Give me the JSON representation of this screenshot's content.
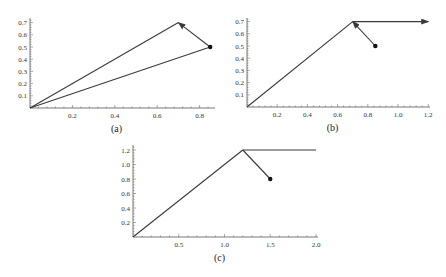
{
  "figure": {
    "background": "#ffffff",
    "line_color": "#3a3a3a"
  },
  "chart_data": [
    {
      "id": "a",
      "type": "line",
      "caption": "(a)",
      "xlabel": "",
      "ylabel": "",
      "xlim": [
        0,
        0.87
      ],
      "ylim": [
        0,
        0.72
      ],
      "xticks": [
        0.2,
        0.4,
        0.6,
        0.8
      ],
      "xtick_labels": [
        "0.2",
        "0.4",
        "0.6",
        "0.8"
      ],
      "yticks": [
        0.1,
        0.2,
        0.3,
        0.4,
        0.5,
        0.6,
        0.7
      ],
      "ytick_labels": [
        "0.1",
        "0.2",
        "0.3",
        "0.4",
        "0.5",
        "0.6",
        "0.7"
      ],
      "grid": false,
      "series": [
        {
          "name": "segment-origin-to-peak",
          "x": [
            0,
            0.7
          ],
          "y": [
            0,
            0.7
          ],
          "arrow": false
        },
        {
          "name": "segment-origin-to-point",
          "x": [
            0,
            0.85
          ],
          "y": [
            0,
            0.5
          ],
          "arrow": false
        },
        {
          "name": "arrow-point-to-peak",
          "x": [
            0.85,
            0.7
          ],
          "y": [
            0.5,
            0.7
          ],
          "arrow": true
        }
      ],
      "points": [
        {
          "x": 0.85,
          "y": 0.5,
          "marker": "dot"
        }
      ],
      "frame": {
        "x0": 30,
        "y0": 108,
        "px_per_x": 212,
        "px_per_y": 122,
        "x_end": 215,
        "y_top": 18
      }
    },
    {
      "id": "b",
      "type": "line",
      "caption": "(b)",
      "xlabel": "",
      "ylabel": "",
      "xlim": [
        0,
        1.2
      ],
      "ylim": [
        0,
        0.72
      ],
      "xticks": [
        0.2,
        0.4,
        0.6,
        0.8,
        1.0,
        1.2
      ],
      "xtick_labels": [
        "0.2",
        "0.4",
        "0.6",
        "0.8",
        "1.0",
        "1.2"
      ],
      "yticks": [
        0.1,
        0.2,
        0.3,
        0.4,
        0.5,
        0.6,
        0.7
      ],
      "ytick_labels": [
        "0.1",
        "0.2",
        "0.3",
        "0.4",
        "0.5",
        "0.6",
        "0.7"
      ],
      "grid": false,
      "series": [
        {
          "name": "segment-origin-to-peak",
          "x": [
            0,
            0.7
          ],
          "y": [
            0,
            0.7
          ],
          "arrow": false
        },
        {
          "name": "arrow-peak-horizontal",
          "x": [
            0.7,
            1.2
          ],
          "y": [
            0.7,
            0.7
          ],
          "arrow": true
        },
        {
          "name": "arrow-point-to-peak",
          "x": [
            0.85,
            0.7
          ],
          "y": [
            0.5,
            0.7
          ],
          "arrow": true
        }
      ],
      "points": [
        {
          "x": 0.85,
          "y": 0.5,
          "marker": "dot"
        }
      ],
      "frame": {
        "x0": 247,
        "y0": 107,
        "px_per_x": 151,
        "px_per_y": 122,
        "x_end": 430,
        "y_top": 18
      }
    },
    {
      "id": "c",
      "type": "line",
      "caption": "(c)",
      "xlabel": "",
      "ylabel": "",
      "xlim": [
        0,
        2.0
      ],
      "ylim": [
        0,
        1.25
      ],
      "xticks": [
        0.5,
        1.0,
        1.5,
        2.0
      ],
      "xtick_labels": [
        "0.5",
        "1.0",
        "1.5",
        "2.0"
      ],
      "yticks": [
        0.2,
        0.4,
        0.6,
        0.8,
        1.0,
        1.2
      ],
      "ytick_labels": [
        "0.2",
        "0.4",
        "0.6",
        "0.8",
        "1.0",
        "1.2"
      ],
      "grid": false,
      "series": [
        {
          "name": "segment-origin-to-peak",
          "x": [
            0,
            1.2
          ],
          "y": [
            0,
            1.2
          ],
          "arrow": false
        },
        {
          "name": "segment-peak-horizontal",
          "x": [
            1.2,
            2.0
          ],
          "y": [
            1.2,
            1.2
          ],
          "arrow": false
        },
        {
          "name": "segment-point-to-peak",
          "x": [
            1.5,
            1.2
          ],
          "y": [
            0.8,
            1.2
          ],
          "arrow": false
        }
      ],
      "points": [
        {
          "x": 1.5,
          "y": 0.8,
          "marker": "dot"
        }
      ],
      "frame": {
        "x0": 133,
        "y0": 237,
        "px_per_x": 91.5,
        "px_per_y": 72.5,
        "x_end": 318,
        "y_top": 145
      }
    }
  ]
}
